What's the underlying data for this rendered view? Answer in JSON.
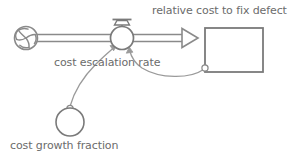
{
  "diagram": {
    "type": "stock-and-flow",
    "background_color": "#ffffff",
    "stroke_color": "#7a7a7a",
    "text_color": "#6b6b6b",
    "nodes": {
      "source_cloud": {
        "icon": "cloud-source-icon",
        "label": "",
        "cx": 26,
        "cy": 38,
        "r": 12
      },
      "flow_valve": {
        "icon": "valve-icon",
        "label": "cost escalation rate",
        "cx": 122,
        "cy": 38,
        "r": 12
      },
      "stock": {
        "icon": "stock-box-icon",
        "label": "relative cost to fix defect",
        "x": 205,
        "y": 28,
        "width": 58,
        "height": 44
      },
      "auxiliary": {
        "icon": "auxiliary-variable-icon",
        "label": "cost growth fraction",
        "cx": 70,
        "cy": 122,
        "r": 14
      }
    },
    "connections": [
      {
        "name": "flow-pipe",
        "from": "source_cloud",
        "to": "stock",
        "style": "double-line-pipe-with-hollow-arrowhead"
      },
      {
        "name": "causal-link-aux-to-valve",
        "from": "auxiliary",
        "to": "flow_valve",
        "style": "curved-arrow"
      },
      {
        "name": "causal-link-stock-to-valve",
        "from": "stock",
        "to": "flow_valve",
        "style": "curved-arrow"
      }
    ]
  },
  "labels": {
    "stock_label": "relative cost to fix defect",
    "flow_label": "cost escalation rate",
    "aux_label": "cost growth fraction"
  }
}
